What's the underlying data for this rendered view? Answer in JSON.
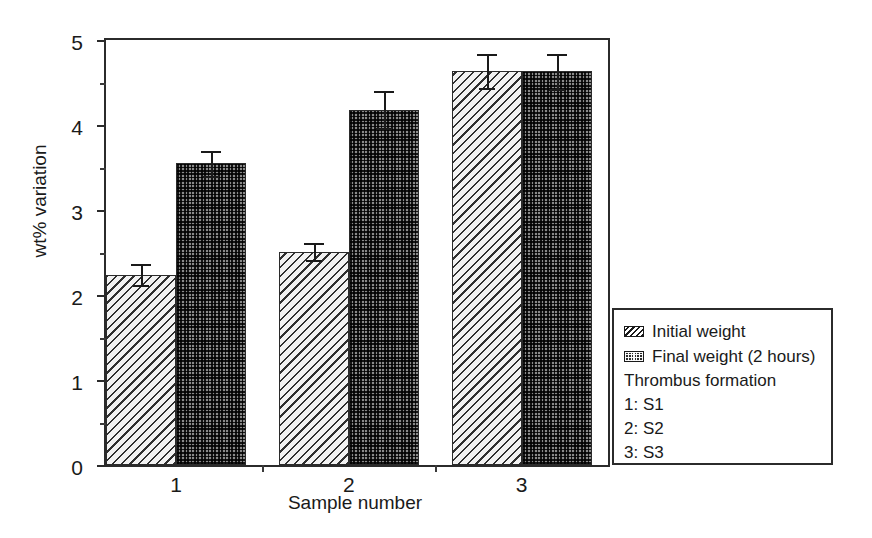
{
  "chart_data": {
    "type": "bar",
    "title": "",
    "xlabel": "Sample number",
    "ylabel": "wt% variation",
    "categories": [
      "1",
      "2",
      "3"
    ],
    "ylim": [
      0,
      5
    ],
    "yticks": [
      "0",
      "1",
      "2",
      "3",
      "4",
      "5"
    ],
    "ytick_minor_step": 0.5,
    "grid": false,
    "legend_position": "right-outside",
    "series": [
      {
        "name": "Initial weight",
        "pattern": "diagonal-hatch",
        "values": [
          2.24,
          2.51,
          4.63
        ],
        "errors": [
          0.12,
          0.1,
          0.2
        ]
      },
      {
        "name": "Final weight (2 hours)",
        "pattern": "checker",
        "values": [
          3.55,
          4.18,
          4.63
        ],
        "errors": [
          0.15,
          0.22,
          0.21
        ]
      }
    ],
    "annotations": [
      "Thrombus formation",
      "1: S1",
      "2: S2",
      "3: S3"
    ]
  },
  "legend": {
    "entries": [
      {
        "label": "Initial weight",
        "swatch": "diagonal-hatch-swatch"
      },
      {
        "label": "Final weight (2 hours)",
        "swatch": "checker-swatch"
      }
    ],
    "notes": [
      "Thrombus formation",
      "1: S1",
      "2: S2",
      "3: S3"
    ]
  },
  "colors": {
    "axis": "#2b2b2b",
    "text": "#1a1a1a",
    "background": "#ffffff",
    "bar_initial_fill": "#f2f2f2",
    "bar_final_fill": "#8a8a8a"
  }
}
